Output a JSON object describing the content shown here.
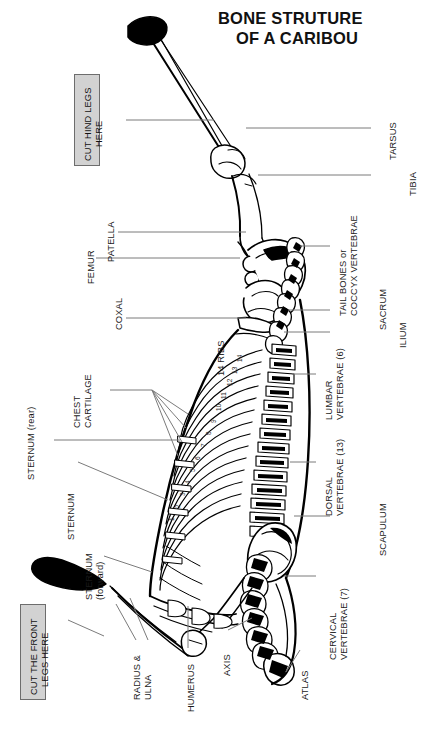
{
  "title": {
    "line1": "BONE STRUTURE",
    "line2": "OF A CARIBOU"
  },
  "cut_boxes": [
    {
      "name": "cut-hind-legs",
      "line1": "CUT HIND LEGS",
      "line2": "HERE"
    },
    {
      "name": "cut-front-legs",
      "line1": "CUT THE FRONT",
      "line2": "LEGS HERE"
    }
  ],
  "labels": [
    {
      "name": "tarsus",
      "line1": "TARSUS",
      "line2": ""
    },
    {
      "name": "tibia",
      "line1": "TIBIA",
      "line2": ""
    },
    {
      "name": "patella",
      "line1": "PATELLA",
      "line2": ""
    },
    {
      "name": "femur",
      "line1": "FEMUR",
      "line2": ""
    },
    {
      "name": "coxal",
      "line1": "COXAL",
      "line2": ""
    },
    {
      "name": "tail-bones",
      "line1": "TAIL BONES or",
      "line2": "COCCYX VERTEBRAE"
    },
    {
      "name": "sacrum",
      "line1": "SACRUM",
      "line2": ""
    },
    {
      "name": "ilium",
      "line1": "ILIUM",
      "line2": ""
    },
    {
      "name": "lumbar-vertebrae",
      "line1": "LUMBAR",
      "line2": "VERTEBRAE (6)"
    },
    {
      "name": "dorsal-vertebrae",
      "line1": "DORSAL",
      "line2": "VERTEBRAE (13)"
    },
    {
      "name": "scapulum",
      "line1": "SCAPULUM",
      "line2": ""
    },
    {
      "name": "cervical-vertebrae",
      "line1": "CERVICAL",
      "line2": "VERTEBRAE (7)"
    },
    {
      "name": "atlas",
      "line1": "ATLAS",
      "line2": ""
    },
    {
      "name": "axis",
      "line1": "AXIS",
      "line2": ""
    },
    {
      "name": "humerus",
      "line1": "HUMERUS",
      "line2": ""
    },
    {
      "name": "radius-ulna",
      "line1": "RADIUS &",
      "line2": "ULNA"
    },
    {
      "name": "sternum-forward",
      "line1": "STERNUM",
      "line2": "(forward)"
    },
    {
      "name": "sternum",
      "line1": "STERNUM",
      "line2": ""
    },
    {
      "name": "sternum-rear",
      "line1": "STERNUM (rear)",
      "line2": ""
    },
    {
      "name": "chest-cartilage",
      "line1": "CHEST",
      "line2": "CARTILAGE"
    },
    {
      "name": "ribs-count",
      "line1": "14 RIBS",
      "line2": ""
    }
  ],
  "rib_numbers": [
    "14",
    "13",
    "12",
    "11",
    "10",
    "9",
    "8",
    "7",
    "6",
    "5",
    "4",
    "3",
    "2",
    "1"
  ],
  "colors": {
    "background": "#ffffff",
    "ink": "#000000",
    "leader": "#7b7b7b",
    "cut_box_fill": "#d2d2d2",
    "cut_box_border": "#6d6d6d",
    "title": "#111111"
  }
}
